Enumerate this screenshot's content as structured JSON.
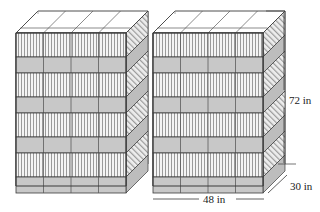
{
  "figure": {
    "type": "isometric-solid-diagram",
    "background_color": "#ffffff",
    "stroke_color": "#3a3a3a",
    "gray_band_color": "#c8c8c8",
    "stripe_band_color": "#f2f2f2",
    "stripe_line_color": "#8a8a8a",
    "top_face_color": "#ffffff",
    "side_face_color": "#d0d0d0"
  },
  "stacks": [
    {
      "name": "left-stack",
      "origin_x": 16,
      "front_width": 110,
      "depth_dx": 22,
      "depth_dy": -22
    },
    {
      "name": "right-stack",
      "origin_x": 153,
      "front_width": 110,
      "depth_dx": 22,
      "depth_dy": -22
    }
  ],
  "geometry": {
    "front_top_y": 33,
    "front_bottom_y": 186,
    "columns": 4,
    "striped_band_count": 4,
    "gray_band_count": 4,
    "band_rows": [
      {
        "kind": "striped",
        "y": 33,
        "height": 24
      },
      {
        "kind": "gray",
        "y": 57,
        "height": 16
      },
      {
        "kind": "striped",
        "y": 73,
        "height": 24
      },
      {
        "kind": "gray",
        "y": 97,
        "height": 16
      },
      {
        "kind": "striped",
        "y": 113,
        "height": 24
      },
      {
        "kind": "gray",
        "y": 137,
        "height": 16
      },
      {
        "kind": "striped",
        "y": 153,
        "height": 24
      },
      {
        "kind": "gray",
        "y": 177,
        "height": 16
      }
    ],
    "stripe_spacing": 3
  },
  "dimensions": {
    "height_label": "72 in",
    "width_label": "48 in",
    "depth_label": "30 in",
    "height_value": 72,
    "width_value": 48,
    "depth_value": 30,
    "unit": "in"
  },
  "labels": {
    "height": {
      "text": "72 in",
      "x": 289,
      "y": 100
    },
    "width": {
      "text": "48 in",
      "x": 208,
      "y": 203
    },
    "depth": {
      "text": "30 in",
      "x": 291,
      "y": 189
    }
  }
}
